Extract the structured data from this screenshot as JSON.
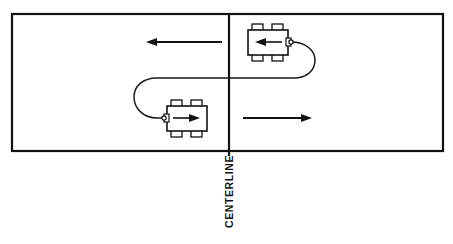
{
  "diagram": {
    "title": "CENTERLINE",
    "labels": {
      "centerline": "CENTERLINE"
    },
    "colors": {
      "ink": "#111111",
      "paper": "#ffffff",
      "path": "#1a1a1a"
    },
    "road": {
      "name": "two-lane roadway",
      "border_left": 12,
      "border_top": 14,
      "border_right": 443,
      "border_bottom": 151,
      "centerline_x": 229
    },
    "lanes": [
      {
        "id": "upper-lane",
        "direction": "left",
        "arrow_label": "",
        "arrow_from_x": 222,
        "arrow_to_x": 147,
        "arrow_y": 42
      },
      {
        "id": "lower-lane",
        "direction": "right",
        "arrow_label": "",
        "arrow_from_x": 243,
        "arrow_to_x": 312,
        "arrow_y": 118
      }
    ],
    "vehicles": [
      {
        "id": "upper-vehicle",
        "name": "car-upper",
        "facing": "left",
        "x": 248,
        "y": 30,
        "width": 40,
        "height": 25
      },
      {
        "id": "lower-vehicle",
        "name": "car-lower",
        "facing": "right",
        "x": 167,
        "y": 106,
        "width": 40,
        "height": 25
      }
    ],
    "maneuver": {
      "name": "u-turn-path",
      "description": "continuous u-turn trajectory crossing the centerline",
      "u_turn_right_radius": 25,
      "u_turn_left_radius": 22
    }
  }
}
